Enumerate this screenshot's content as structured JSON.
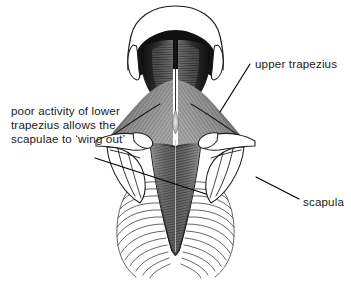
{
  "figure": {
    "background_color": "#ffffff",
    "ink_color": "#1c1c1c",
    "text_color": "#1a1a1a",
    "width": 351,
    "height": 287
  },
  "annotations": [
    {
      "id": "upper-trapezius",
      "text": "upper trapezius",
      "lines": [
        "upper trapezius"
      ],
      "text_x": 255,
      "text_y": 68,
      "anchor": "start",
      "leader": {
        "x1": 250,
        "y1": 64,
        "x2": 220,
        "y2": 112
      }
    },
    {
      "id": "lower-trapezius-note",
      "text": "poor activity of lower trapezius allows the scapulae to 'wing out'",
      "lines": [
        "poor activity of lower",
        "trapezius allows the",
        "scapulae to ‘wing out’"
      ],
      "text_x": 11,
      "text_y": 115,
      "line_height": 14,
      "anchor": "start",
      "leader": {
        "x1": 95,
        "y1": 158,
        "x2": 206,
        "y2": 194
      }
    },
    {
      "id": "scapula",
      "text": "scapula",
      "lines": [
        "scapula"
      ],
      "text_x": 303,
      "text_y": 206,
      "anchor": "start",
      "leader": {
        "x1": 256,
        "y1": 177,
        "x2": 299,
        "y2": 199
      }
    }
  ],
  "anatomy": {
    "structures": [
      {
        "name": "skull-outline",
        "label": "head viewed from behind"
      },
      {
        "name": "ear-left",
        "label": "left ear"
      },
      {
        "name": "ear-right",
        "label": "right ear"
      },
      {
        "name": "upper-trapezius-left",
        "label": "upper trapezius left"
      },
      {
        "name": "upper-trapezius-right",
        "label": "upper trapezius right"
      },
      {
        "name": "lower-trapezius",
        "label": "lower trapezius"
      },
      {
        "name": "scapula-left",
        "label": "left scapula"
      },
      {
        "name": "scapula-right",
        "label": "right scapula"
      },
      {
        "name": "clavicle-left",
        "label": "left clavicle and acromion"
      },
      {
        "name": "clavicle-right",
        "label": "right clavicle and acromion"
      },
      {
        "name": "rib-cage-left",
        "label": "left rib cage"
      },
      {
        "name": "rib-cage-right",
        "label": "right rib cage"
      },
      {
        "name": "spine",
        "label": "vertebral column"
      }
    ],
    "rib_count_per_side": 13
  }
}
